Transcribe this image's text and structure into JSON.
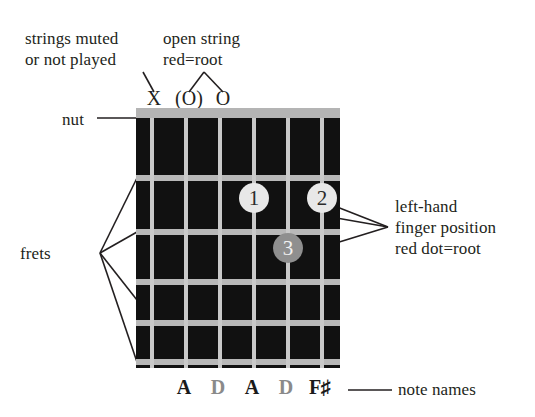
{
  "diagram": {
    "labels": {
      "muted": "strings muted\nor not played",
      "open": "open string\nred=root",
      "nut": "nut",
      "frets": "frets",
      "finger": "left-hand\nfinger position\nred dot=root",
      "note_names": "note names"
    },
    "colors": {
      "fretboard": "#111111",
      "nut": "#b4b4b4",
      "string": "#c9c9c9",
      "fret": "#b8b8b8",
      "dot_light": "#e8e8e8",
      "dot_root": "#8f8f8f",
      "text": "#231f20",
      "note_root": "#1a1a1a",
      "note_plain": "#8a8a8a"
    },
    "string_markers": [
      {
        "string": 1,
        "symbol": "X",
        "meaning": "muted"
      },
      {
        "string": 2,
        "symbol": "(O)",
        "meaning": "open-root"
      },
      {
        "string": 3,
        "symbol": "O",
        "meaning": "open"
      }
    ],
    "finger_dots": [
      {
        "finger": "1",
        "string": 4,
        "fret": 2,
        "style": "light"
      },
      {
        "finger": "2",
        "string": 6,
        "fret": 2,
        "style": "light"
      },
      {
        "finger": "3",
        "string": 5,
        "fret": 3,
        "style": "dark"
      }
    ],
    "note_names": [
      {
        "note": "A",
        "emphasis": "root"
      },
      {
        "note": "D",
        "emphasis": "plain"
      },
      {
        "note": "A",
        "emphasis": "root"
      },
      {
        "note": "D",
        "emphasis": "plain"
      },
      {
        "note": "F♯",
        "emphasis": "root"
      }
    ],
    "string_count": 6,
    "fret_count": 5
  }
}
